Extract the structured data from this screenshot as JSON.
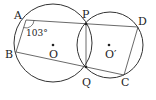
{
  "diagram": {
    "type": "geometry",
    "circles": [
      {
        "name": "O",
        "label": "O",
        "cx": 53,
        "cy": 43,
        "r": 39
      },
      {
        "name": "O'",
        "label": "O′",
        "cx": 110,
        "cy": 45,
        "r": 33
      }
    ],
    "points": {
      "A": {
        "label": "A",
        "x": 26,
        "y": 20
      },
      "B": {
        "label": "B",
        "x": 16,
        "y": 52
      },
      "P": {
        "label": "P",
        "x": 86,
        "y": 24
      },
      "Q": {
        "label": "Q",
        "x": 86,
        "y": 67
      },
      "C": {
        "label": "C",
        "x": 124,
        "y": 75
      },
      "D": {
        "label": "D",
        "x": 138,
        "y": 27
      }
    },
    "segments": [
      "A-D",
      "A-B",
      "B-C",
      "P-Q",
      "D-C"
    ],
    "angle_annotation": {
      "vertex": "A",
      "value": "103°"
    },
    "stroke_color": "#333333"
  }
}
